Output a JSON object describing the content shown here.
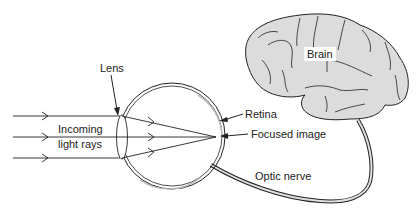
{
  "diagram": {
    "type": "anatomy-eye-brain",
    "labels": {
      "lens": "Lens",
      "incoming_line1": "Incoming",
      "incoming_line2": "light rays",
      "retina": "Retina",
      "focused_image": "Focused image",
      "optic_nerve": "Optic nerve",
      "brain": "Brain"
    },
    "colors": {
      "stroke": "#222222",
      "brain_fill": "#dcdcdc",
      "nerve_fill": "#cfcfcf",
      "background": "#ffffff"
    }
  }
}
